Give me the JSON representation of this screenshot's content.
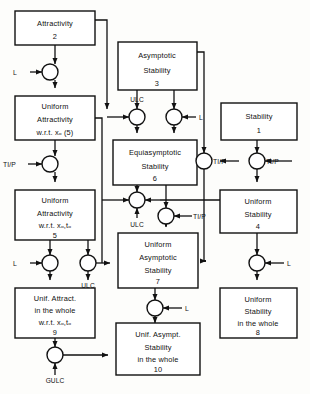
{
  "figure": {
    "type": "flow-diagram",
    "title": "",
    "background": "#fdfdfb",
    "line_color": "#111111"
  },
  "nodes": [
    {
      "id": "n2",
      "name": "attractivity",
      "lines": [
        "Attractivity"
      ],
      "number": "2",
      "x": 15,
      "y": 11,
      "w": 80,
      "h": 34
    },
    {
      "id": "n5a",
      "name": "uniform-attractivity-xo",
      "lines": [
        "Uniform",
        "Attractivity",
        "w.r.t. xₒ  (5)"
      ],
      "number": "",
      "x": 15,
      "y": 96,
      "w": 80,
      "h": 44
    },
    {
      "id": "n5",
      "name": "uniform-attractivity-xo-to",
      "lines": [
        "Uniform",
        "Attractivity",
        "w.r.t. xₒ,tₒ"
      ],
      "number": "5",
      "x": 15,
      "y": 190,
      "w": 80,
      "h": 50
    },
    {
      "id": "n9",
      "name": "unif-attract-in-the-whole",
      "lines": [
        "Unif. Attract.",
        "in the  whole",
        "w.r.t. xₒ,tₒ"
      ],
      "number": "9",
      "x": 15,
      "y": 288,
      "w": 80,
      "h": 50
    },
    {
      "id": "n3",
      "name": "asymptotic-stability",
      "lines": [
        "Asymptotic",
        "Stability"
      ],
      "number": "3",
      "x": 118,
      "y": 42,
      "w": 79,
      "h": 48
    },
    {
      "id": "n6",
      "name": "equiasymptotic-stability",
      "lines": [
        "Equiasymptotic",
        "Stability"
      ],
      "number": "6",
      "x": 113,
      "y": 140,
      "w": 84,
      "h": 45
    },
    {
      "id": "n7",
      "name": "uniform-asymptotic-stability",
      "lines": [
        "Uniform",
        "Asymptotic",
        "Stability"
      ],
      "number": "7",
      "x": 118,
      "y": 233,
      "w": 80,
      "h": 55
    },
    {
      "id": "n10",
      "name": "unif-asympt-stability-in-the-whole",
      "lines": [
        "Unif. Asympt.",
        "Stability",
        "in the  whole"
      ],
      "number": "10",
      "x": 116,
      "y": 323,
      "w": 84,
      "h": 52
    },
    {
      "id": "n1",
      "name": "stability",
      "lines": [
        "Stability"
      ],
      "number": "1",
      "x": 221,
      "y": 103,
      "w": 76,
      "h": 37
    },
    {
      "id": "n4",
      "name": "uniform-stability",
      "lines": [
        "Uniform",
        "Stability"
      ],
      "number": "4",
      "x": 220,
      "y": 190,
      "w": 77,
      "h": 43
    },
    {
      "id": "n8",
      "name": "uniform-stability-in-the-whole",
      "lines": [
        "Uniform",
        "Stability",
        "in the  whole"
      ],
      "number": "8",
      "x": 220,
      "y": 288,
      "w": 77,
      "h": 50
    }
  ],
  "junctions": [
    {
      "id": "j1",
      "name": "junction-l-attractivity",
      "cx": 50,
      "cy": 72,
      "r": 8,
      "label": "L",
      "label_pos": "left"
    },
    {
      "id": "j2",
      "name": "junction-tip-uniform-attractivity",
      "cx": 50,
      "cy": 164,
      "r": 8,
      "label": "TI/P",
      "label_pos": "left"
    },
    {
      "id": "j3",
      "name": "junction-l-unif-attract-whole",
      "cx": 50,
      "cy": 263,
      "r": 8,
      "label": "L",
      "label_pos": "left"
    },
    {
      "id": "j4",
      "name": "junction-ulc-to-uniform-asymptotic",
      "cx": 88,
      "cy": 263,
      "r": 8,
      "label": "ULC",
      "label_pos": "below"
    },
    {
      "id": "j5",
      "name": "junction-gulc",
      "cx": 55,
      "cy": 355,
      "r": 8,
      "label": "GULC",
      "label_pos": "below"
    },
    {
      "id": "j6",
      "name": "junction-ulc-equiasymptotic",
      "cx": 137,
      "cy": 117,
      "r": 8,
      "label": "ULC",
      "label_pos": "above"
    },
    {
      "id": "j7",
      "name": "junction-l-equiasymptotic",
      "cx": 174,
      "cy": 117,
      "r": 8,
      "label": "L",
      "label_pos": "right"
    },
    {
      "id": "j8",
      "name": "junction-ulc-uniform-asymptotic",
      "cx": 137,
      "cy": 200,
      "r": 8,
      "label": "ULC",
      "label_pos": "below"
    },
    {
      "id": "j9",
      "name": "junction-tip-uniform-asymptotic",
      "cx": 166,
      "cy": 216,
      "r": 8,
      "label": "TI/P",
      "label_pos": "right"
    },
    {
      "id": "j10",
      "name": "junction-l-unif-asympt-whole",
      "cx": 155,
      "cy": 308,
      "r": 8,
      "label": "L",
      "label_pos": "right"
    },
    {
      "id": "j11",
      "name": "junction-tip-left-of-stability",
      "cx": 212,
      "cy": 161,
      "r": 8,
      "label": "TI/P",
      "label_pos": "right"
    },
    {
      "id": "j12",
      "name": "junction-tip-uniform-stability",
      "cx": 257,
      "cy": 161,
      "r": 8,
      "label": "TI/P",
      "label_pos": "right"
    },
    {
      "id": "j13",
      "name": "junction-l-uniform-stability-whole",
      "cx": 257,
      "cy": 263,
      "r": 8,
      "label": "L",
      "label_pos": "right"
    }
  ],
  "edge_labels": {
    "l": "L",
    "tip": "TI/P",
    "ulc": "ULC",
    "gulc": "GULC"
  }
}
